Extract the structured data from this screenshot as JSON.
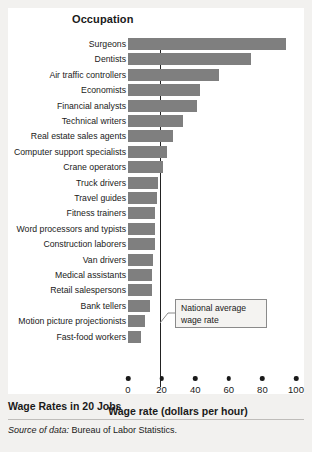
{
  "figure": {
    "y_axis_title": "Occupation",
    "caption_title": "Wage Rates in 20 Jobs",
    "source_label": "Source of data:",
    "source_text": "Bureau of Labor Statistics.",
    "callout_line1": "National average",
    "callout_line2": "wage rate"
  },
  "colors": {
    "bar": "#7f7f7f",
    "panel": "#ffffff",
    "background": "#f2f1ef",
    "average_line": "#222222",
    "callout_border": "#8a8a8a",
    "callout_fill": "#f4f3f1",
    "text": "#1a1a1a"
  },
  "chart_data": {
    "type": "bar",
    "orientation": "horizontal",
    "title": "Wage Rates in 20 Jobs",
    "xlabel": "Wage rate (dollars per hour)",
    "ylabel": "Occupation",
    "xlim": [
      0,
      100
    ],
    "xticks": [
      0,
      20,
      40,
      60,
      80,
      100
    ],
    "xtick_labels": [
      "0",
      "20",
      "40",
      "60",
      "80",
      "100"
    ],
    "grid": false,
    "legend": "none",
    "categories": [
      "Surgeons",
      "Dentists",
      "Air traffic controllers",
      "Economists",
      "Financial analysts",
      "Technical writers",
      "Real estate sales agents",
      "Computer support specialists",
      "Crane operators",
      "Truck drivers",
      "Travel guides",
      "Fitness trainers",
      "Word processors and typists",
      "Construction laborers",
      "Van drivers",
      "Medical assistants",
      "Retail salespersons",
      "Bank tellers",
      "Motion picture projectionists",
      "Fast-food workers"
    ],
    "values": [
      94,
      73,
      54,
      43,
      41,
      33,
      27,
      23,
      21,
      18,
      17,
      16,
      16,
      16,
      15,
      14,
      14,
      13,
      10,
      8
    ],
    "annotations": [
      {
        "type": "vertical-line",
        "label": "National average wage rate",
        "value": 19
      }
    ]
  }
}
